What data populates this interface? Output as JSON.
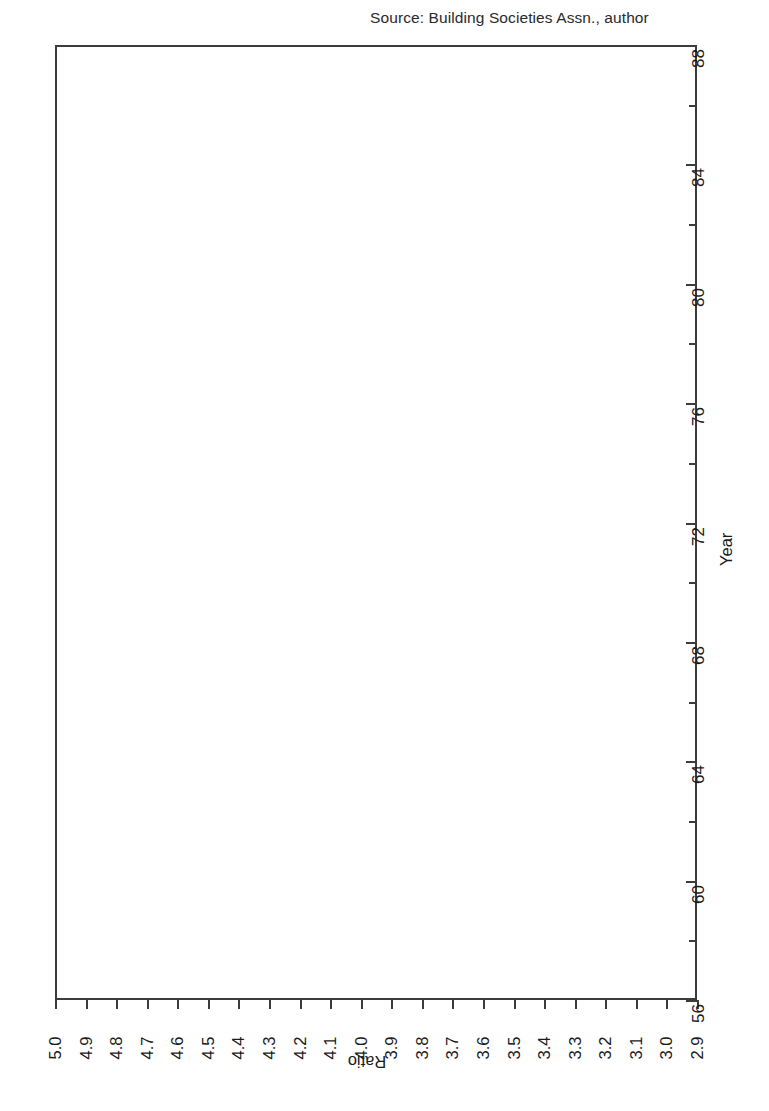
{
  "figure": {
    "title": "Average House Price/Earnings Ratio",
    "source_note": "Source: Building Societies Assn., author",
    "orientation": "rotated-90",
    "line_color": "#111111",
    "axis_color": "#3c3c3c"
  },
  "axes": {
    "value_axis": {
      "title": "Ratio",
      "tick_labels": [
        "5.0",
        "4.9",
        "4.8",
        "4.7",
        "4.6",
        "4.5",
        "4.4",
        "4.3",
        "4.2",
        "4.1",
        "4.0",
        "3.9",
        "3.8",
        "3.7",
        "3.6",
        "3.5",
        "3.4",
        "3.3",
        "3.2",
        "3.1",
        "3.0",
        "2.9"
      ],
      "min": 2.9,
      "max": 5.0,
      "step": 0.1,
      "direction": "descending-left-to-right"
    },
    "category_axis": {
      "title": "Year",
      "tick_labels": [
        "88",
        "84",
        "80",
        "76",
        "72",
        "68",
        "64",
        "60",
        "56"
      ],
      "minor_ticks": [
        "86",
        "82",
        "78",
        "74",
        "70",
        "66",
        "62",
        "58"
      ],
      "min": 56,
      "max": 88,
      "step": 4,
      "minor_step": 2,
      "direction": "descending-top-to-bottom"
    }
  },
  "chart_data": {
    "type": "line",
    "title": "Average House Price/Earnings Ratio",
    "subtitle": "Source: Building Societies Assn., author",
    "xlabel": "Ratio",
    "ylabel": "Year",
    "xlim": [
      2.9,
      5.0
    ],
    "ylim": [
      56,
      88
    ],
    "grid": false,
    "legend": "none",
    "orientation": "horizontal-year-axis-vertical",
    "x": [
      1956,
      1957,
      1958,
      1959,
      1960,
      1961,
      1962,
      1963,
      1964,
      1965,
      1966,
      1967,
      1968,
      1969,
      1970,
      1971,
      1972,
      1973,
      1974,
      1975,
      1976,
      1977,
      1978,
      1979,
      1980,
      1981,
      1982,
      1983,
      1984,
      1985,
      1986,
      1987,
      1988
    ],
    "categories": [
      "56",
      "57",
      "58",
      "59",
      "60",
      "61",
      "62",
      "63",
      "64",
      "65",
      "66",
      "67",
      "68",
      "69",
      "70",
      "71",
      "72",
      "73",
      "74",
      "75",
      "76",
      "77",
      "78",
      "79",
      "80",
      "81",
      "82",
      "83",
      "84",
      "85",
      "86",
      "87",
      "88"
    ],
    "values": [
      3.2,
      3.11,
      3.09,
      2.98,
      2.9,
      2.97,
      3.06,
      3.16,
      3.27,
      3.33,
      3.37,
      3.4,
      3.51,
      3.45,
      3.35,
      3.55,
      4.15,
      4.95,
      4.55,
      4.05,
      3.55,
      3.45,
      3.5,
      3.8,
      3.68,
      3.52,
      3.33,
      3.42,
      3.46,
      3.45,
      3.54,
      3.85,
      4.4
    ],
    "series": [
      {
        "name": "Average House Price/Earnings Ratio",
        "values": [
          3.2,
          3.11,
          3.09,
          2.98,
          2.9,
          2.97,
          3.06,
          3.16,
          3.27,
          3.33,
          3.37,
          3.4,
          3.51,
          3.45,
          3.35,
          3.55,
          4.15,
          4.95,
          4.55,
          4.05,
          3.55,
          3.45,
          3.5,
          3.8,
          3.68,
          3.52,
          3.33,
          3.42,
          3.46,
          3.45,
          3.54,
          3.85,
          4.4
        ]
      }
    ],
    "annotations": [
      {
        "label": "peak",
        "year": 1973,
        "value": 4.95
      },
      {
        "label": "trough",
        "year": 1960,
        "value": 2.9
      },
      {
        "label": "secondary peak",
        "year": 1979,
        "value": 3.8
      },
      {
        "label": "secondary trough",
        "year": 1982,
        "value": 3.33
      }
    ]
  }
}
